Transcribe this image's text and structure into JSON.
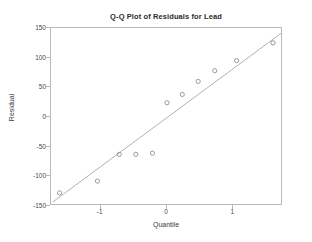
{
  "chart_data": {
    "type": "scatter",
    "title": "Q-Q Plot of Residuals for Lead",
    "xlabel": "Quantile",
    "ylabel": "Residual",
    "xlim": [
      -1.75,
      1.75
    ],
    "ylim": [
      -150,
      150
    ],
    "xticks": [
      -1,
      0,
      1
    ],
    "xtick_labels": [
      "-1",
      "0",
      "1"
    ],
    "yticks": [
      150,
      100,
      50,
      0,
      -50,
      -100,
      -150
    ],
    "ytick_labels": [
      "150",
      "100",
      "50",
      "0",
      "-50",
      "-100",
      "-150"
    ],
    "grid": false,
    "legend": null,
    "marker_style": "open-circle",
    "marker_color": "#8e8e96",
    "reference_line": {
      "label": "normal reference line",
      "color": "#b0b0b8",
      "x": [
        -1.72,
        1.72
      ],
      "y": [
        -143,
        141
      ]
    },
    "x": [
      -1.62,
      -1.05,
      -0.72,
      -0.47,
      -0.22,
      0.0,
      0.23,
      0.47,
      0.72,
      1.05,
      1.6
    ],
    "y": [
      -128,
      -108,
      -63,
      -63,
      -61,
      24,
      38,
      60,
      78,
      95,
      125
    ],
    "points": [
      {
        "x": -1.62,
        "y": -128
      },
      {
        "x": -1.05,
        "y": -108
      },
      {
        "x": -0.72,
        "y": -63
      },
      {
        "x": -0.47,
        "y": -63
      },
      {
        "x": -0.22,
        "y": -61
      },
      {
        "x": 0.0,
        "y": 24
      },
      {
        "x": 0.23,
        "y": 38
      },
      {
        "x": 0.47,
        "y": 60
      },
      {
        "x": 0.72,
        "y": 78
      },
      {
        "x": 1.05,
        "y": 95
      },
      {
        "x": 1.6,
        "y": 125
      }
    ]
  },
  "figure": {
    "background_color": "#ffffff",
    "frame_color": "#b9b9b9"
  }
}
